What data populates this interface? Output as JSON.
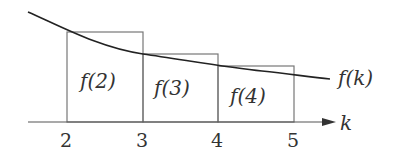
{
  "diagram": {
    "axis_label": "k",
    "curve_label": "f(k)",
    "ticks": [
      "2",
      "3",
      "4",
      "5"
    ],
    "rectangles": [
      {
        "label": "f(2)",
        "x_from": 2,
        "x_to": 3
      },
      {
        "label": "f(3)",
        "x_from": 3,
        "x_to": 4
      },
      {
        "label": "f(4)",
        "x_from": 4,
        "x_to": 5
      }
    ],
    "colors": {
      "stroke": "#555555",
      "curve": "#222222",
      "text": "#333333"
    }
  }
}
